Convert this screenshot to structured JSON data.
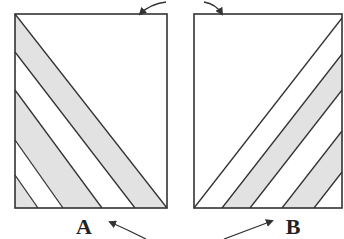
{
  "figure": {
    "panels": [
      {
        "id": "A",
        "label": "A",
        "box": {
          "x": 15,
          "y": 14,
          "w": 152,
          "h": 194
        },
        "stripe_direction": "down-right",
        "stripe_lines": [
          [
            [
              15,
              14
            ],
            [
              167,
              208
            ]
          ],
          [
            [
              15,
              52
            ],
            [
              135,
              208
            ]
          ],
          [
            [
              15,
              90
            ],
            [
              102,
              208
            ]
          ],
          [
            [
              15,
              140
            ],
            [
              63,
              208
            ]
          ],
          [
            [
              15,
              175
            ],
            [
              38,
              208
            ]
          ]
        ],
        "gray_bands": [
          [
            [
              15,
              14
            ],
            [
              167,
              208
            ],
            [
              135,
              208
            ],
            [
              15,
              52
            ]
          ],
          [
            [
              15,
              90
            ],
            [
              102,
              208
            ],
            [
              63,
              208
            ],
            [
              15,
              140
            ]
          ],
          [
            [
              15,
              175
            ],
            [
              38,
              208
            ],
            [
              15,
              208
            ]
          ]
        ]
      },
      {
        "id": "B",
        "label": "B",
        "box": {
          "x": 194,
          "y": 14,
          "w": 148,
          "h": 194
        },
        "stripe_direction": "up-right",
        "stripe_lines": [
          [
            [
              194,
              208
            ],
            [
              342,
              18
            ]
          ],
          [
            [
              222,
              208
            ],
            [
              342,
              54
            ]
          ],
          [
            [
              250,
              208
            ],
            [
              342,
              90
            ]
          ],
          [
            [
              282,
              208
            ],
            [
              342,
              131
            ]
          ],
          [
            [
              314,
              208
            ],
            [
              342,
              172
            ]
          ]
        ],
        "gray_bands": [
          [
            [
              222,
              208
            ],
            [
              342,
              54
            ],
            [
              342,
              90
            ],
            [
              250,
              208
            ]
          ],
          [
            [
              282,
              208
            ],
            [
              342,
              131
            ],
            [
              342,
              172
            ],
            [
              314,
              208
            ]
          ]
        ]
      }
    ],
    "arrows": [
      {
        "name": "top-arrow-to-A",
        "path": "M 166 2 Q 150 4 140 14"
      },
      {
        "name": "top-arrow-to-B",
        "path": "M 204 2 Q 216 4 222 14"
      },
      {
        "name": "bottom-arrow-to-A",
        "path": "M 146 239 Q 128 230 110 222"
      },
      {
        "name": "bottom-arrow-to-B",
        "path": "M 224 239 Q 248 230 272 221"
      }
    ],
    "label_positions": {
      "A": {
        "x": 84,
        "y": 234
      },
      "B": {
        "x": 293,
        "y": 234
      }
    },
    "colors": {
      "stroke": "#333333",
      "band_fill": "#e2e2e2",
      "background": "#ffffff"
    }
  }
}
